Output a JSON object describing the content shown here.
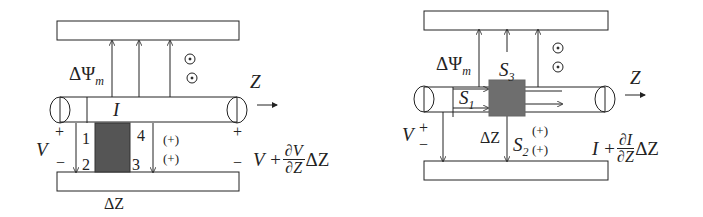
{
  "left_diagram": {
    "flux_label": "ΔΨ",
    "flux_sub": "m",
    "current_label": "I",
    "z_label": "Z",
    "voltage_label": "V",
    "plus_left": "+",
    "minus_left": "−",
    "plus_right": "+",
    "minus_right": "−",
    "corner_1": "1",
    "corner_2": "2",
    "corner_3": "3",
    "corner_4": "4",
    "sign_top": "(+)",
    "sign_bottom": "(+)",
    "delta_z": "ΔZ",
    "right_expr_prefix": "V +",
    "right_expr_num": "∂V",
    "right_expr_den": "∂Z",
    "right_expr_suffix": "ΔZ"
  },
  "right_diagram": {
    "flux_label": "ΔΨ",
    "flux_sub": "m",
    "s3_label": "S",
    "s3_sub": "3",
    "s1_label": "S",
    "s1_sub": "1",
    "s2_label": "S",
    "s2_sub": "2",
    "sign_top": "(+)",
    "sign_bottom": "(+)",
    "z_label": "Z",
    "voltage_label": "V",
    "plus": "+",
    "minus": "−",
    "delta_z": "ΔZ",
    "right_expr_prefix": "I +",
    "right_expr_num": "∂I",
    "right_expr_den": "∂Z",
    "right_expr_suffix": "ΔZ"
  },
  "colors": {
    "line": "#222222",
    "shade": "#555555",
    "shade_right": "#6e6e6e"
  }
}
